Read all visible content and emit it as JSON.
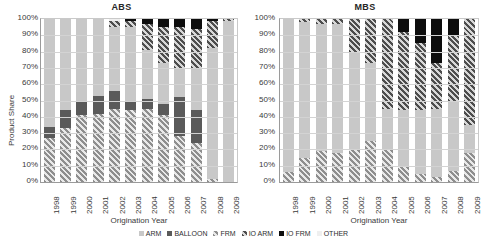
{
  "chart_data": [
    {
      "type": "bar",
      "title": "ABS",
      "xlabel": "Origination Year",
      "ylabel": "Product Share",
      "ylim": [
        0,
        100
      ],
      "yticks": [
        "100%",
        "90%",
        "80%",
        "70%",
        "60%",
        "50%",
        "40%",
        "30%",
        "20%",
        "10%",
        "0%"
      ],
      "grid": true,
      "stacked": true,
      "stack_total": 100,
      "categories": [
        "1998",
        "1999",
        "2000",
        "2001",
        "2002",
        "2003",
        "2004",
        "2005",
        "2006",
        "2007",
        "2008",
        "2009"
      ],
      "series": [
        {
          "name": "FRM",
          "values": [
            27,
            33,
            41,
            42,
            45,
            44,
            45,
            41,
            28,
            24,
            2,
            0
          ]
        },
        {
          "name": "BALLOON",
          "values": [
            7,
            11,
            9,
            11,
            11,
            6,
            6,
            7,
            24,
            20,
            0,
            0
          ]
        },
        {
          "name": "ARM",
          "values": [
            66,
            56,
            50,
            47,
            39,
            45,
            30,
            25,
            18,
            26,
            80,
            99
          ]
        },
        {
          "name": "IO ARM",
          "values": [
            0,
            0,
            0,
            0,
            4,
            4,
            16,
            22,
            25,
            24,
            17,
            1
          ]
        },
        {
          "name": "IO FRM",
          "values": [
            0,
            0,
            0,
            0,
            0,
            1,
            3,
            5,
            5,
            6,
            1,
            0
          ]
        },
        {
          "name": "OTHER",
          "values": [
            0,
            0,
            0,
            0,
            1,
            0,
            0,
            0,
            0,
            0,
            0,
            0
          ]
        }
      ]
    },
    {
      "type": "bar",
      "title": "MBS",
      "xlabel": "Origination Year",
      "ylabel": "Product Share",
      "ylim": [
        0,
        100
      ],
      "yticks": [
        "100%",
        "90%",
        "80%",
        "70%",
        "60%",
        "50%",
        "40%",
        "30%",
        "20%",
        "10%",
        "0%"
      ],
      "grid": true,
      "stacked": true,
      "stack_total": 100,
      "categories": [
        "1998",
        "1999",
        "2000",
        "2001",
        "2002",
        "2003",
        "2004",
        "2005",
        "2006",
        "2007",
        "2008",
        "2009"
      ],
      "series": [
        {
          "name": "FRM",
          "values": [
            6,
            15,
            19,
            18,
            20,
            25,
            20,
            10,
            5,
            3,
            7,
            18
          ]
        },
        {
          "name": "BALLOON",
          "values": [
            0,
            0,
            0,
            0,
            0,
            0,
            0,
            0,
            0,
            0,
            0,
            0
          ]
        },
        {
          "name": "ARM",
          "values": [
            94,
            83,
            78,
            79,
            60,
            48,
            25,
            34,
            39,
            42,
            43,
            17
          ]
        },
        {
          "name": "IO ARM",
          "values": [
            0,
            2,
            3,
            3,
            20,
            27,
            55,
            48,
            41,
            28,
            40,
            65
          ]
        },
        {
          "name": "IO FRM",
          "values": [
            0,
            0,
            0,
            0,
            0,
            0,
            0,
            8,
            15,
            27,
            10,
            0
          ]
        },
        {
          "name": "OTHER",
          "values": [
            0,
            0,
            0,
            0,
            0,
            0,
            0,
            0,
            0,
            0,
            0,
            0
          ]
        }
      ]
    }
  ],
  "legend": {
    "position": "bottom",
    "items": [
      {
        "label": "ARM",
        "key": "arm",
        "color": "#c8c8c8"
      },
      {
        "label": "BALLOON",
        "key": "balloon",
        "color": "#5a5a5a"
      },
      {
        "label": "FRM",
        "key": "frm",
        "color": "#8e8e8e"
      },
      {
        "label": "IO ARM",
        "key": "ioarm",
        "color": "#4d4d4d"
      },
      {
        "label": "IO FRM",
        "key": "iofrm",
        "color": "#0d0d0d"
      },
      {
        "label": "OTHER",
        "key": "other",
        "color": "#efefef"
      }
    ]
  }
}
